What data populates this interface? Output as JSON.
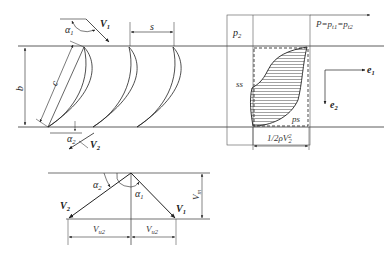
{
  "figure": {
    "cascade": {
      "labels": {
        "inlet_angle": "α",
        "inlet_angle_sub": "1",
        "inlet_velocity": "V",
        "inlet_velocity_sub": "1",
        "pitch": "s",
        "chord": "c",
        "span": "b",
        "outlet_angle": "α",
        "outlet_angle_sub": "2",
        "outlet_velocity": "V",
        "outlet_velocity_sub": "2"
      },
      "blade_count": 3
    },
    "pressure_diagram": {
      "labels": {
        "region_p2": "p",
        "region_p2_sub": "2",
        "pressure_equation": "P=p",
        "pressure_equation_sub1": "t1",
        "pressure_eq_mid": "=p",
        "pressure_equation_sub2": "t2",
        "suction_side": "ss",
        "pressure_side": "ps",
        "dynamic_pressure": "1/2ρV",
        "dynamic_pressure_sup": "2",
        "dynamic_pressure_sub": "2",
        "axis_e1": "e",
        "axis_e1_sub": "1",
        "axis_e2": "e",
        "axis_e2_sub": "2"
      }
    },
    "velocity_triangle": {
      "labels": {
        "v2": "V",
        "v2_sub": "2",
        "v1": "V",
        "v1_sub": "1",
        "alpha2": "α",
        "alpha2_sub": "2",
        "alpha1": "α",
        "alpha1_sub": "1",
        "vm": "V",
        "vm_sub": "m",
        "vu2_left": "V",
        "vu2_left_sub": "u2",
        "vu2_right": "V",
        "vu2_right_sub": "u2"
      }
    }
  }
}
